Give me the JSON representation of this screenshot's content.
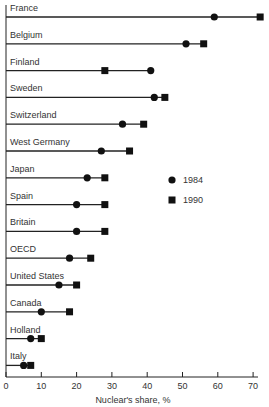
{
  "chart_data": {
    "type": "dot-range",
    "title": "",
    "xlabel": "Nuclear's share, %",
    "ylabel": "",
    "xlim": [
      0,
      70
    ],
    "xticks": [
      0,
      10,
      20,
      30,
      40,
      50,
      60,
      70
    ],
    "legend": [
      {
        "name": "1984",
        "marker": "circle"
      },
      {
        "name": "1990",
        "marker": "square"
      }
    ],
    "categories": [
      "France",
      "Belgium",
      "Finland",
      "Sweden",
      "Switzerland",
      "West Germany",
      "Japan",
      "Spain",
      "Britain",
      "OECD",
      "United States",
      "Canada",
      "Holland",
      "Italy"
    ],
    "series": [
      {
        "name": "1984",
        "values": [
          59,
          51,
          41,
          42,
          33,
          27,
          23,
          20,
          20,
          18,
          15,
          10,
          7,
          5
        ]
      },
      {
        "name": "1990",
        "values": [
          72,
          56,
          28,
          45,
          39,
          35,
          28,
          28,
          28,
          24,
          20,
          18,
          10,
          7
        ]
      }
    ]
  }
}
